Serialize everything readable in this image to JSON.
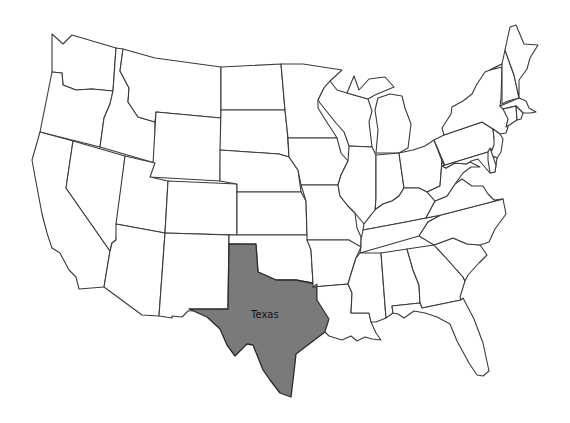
{
  "map": {
    "title": "",
    "region": "Contiguous United States",
    "highlighted_state": "Texas",
    "highlight_color": "#7a7a7a",
    "base_fill": "#ffffff",
    "border_color": "#3a3a3a",
    "labels": [
      {
        "state": "Texas",
        "text": "Texas",
        "x": 251,
        "y": 318
      }
    ]
  }
}
